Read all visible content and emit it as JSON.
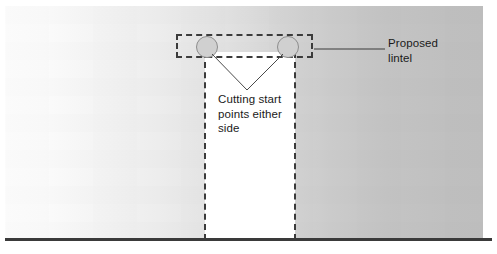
{
  "diagram": {
    "labels": {
      "cutting_points": "Cutting start\npoints either\nside",
      "proposed_lintel": "Proposed\nlintel"
    },
    "elements": {
      "wall_name": "masonry wall elevation",
      "opening_name": "new opening",
      "lintel_name": "proposed lintel outline",
      "circle_left_name": "cutting start point left",
      "circle_right_name": "cutting start point right",
      "ground_name": "ground line"
    },
    "colors": {
      "wall_light": "#fdfdfd",
      "wall_dark": "#bfbfbf",
      "opening_fill": "#ffffff",
      "dash_stroke": "#3b3b3b",
      "circle_fill": "#d0d0d0",
      "circle_stroke": "#8d8d8d",
      "ground_stroke": "#3a3a3a",
      "leader_stroke": "#4a4a4a",
      "text": "#1a1a1a"
    },
    "geometry": {
      "lintel_rect": "176,34 137x24",
      "opening_rect": "205,52 90x188",
      "circle_left_center": "207,47",
      "circle_right_center": "288,47",
      "v_apex": "247,90",
      "lintel_leader": "314,49 to 385,49",
      "ground_y": "239"
    }
  }
}
